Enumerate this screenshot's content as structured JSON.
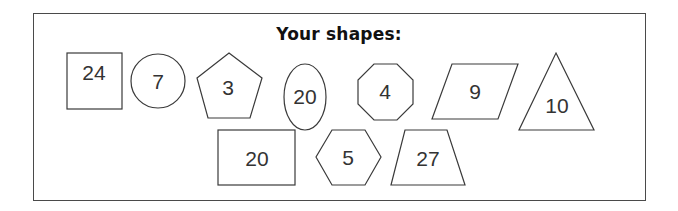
{
  "title": "Your shapes:",
  "shapes": [
    {
      "name": "square",
      "label": "24"
    },
    {
      "name": "circle",
      "label": "7"
    },
    {
      "name": "pentagon",
      "label": "3"
    },
    {
      "name": "ellipse",
      "label": "20"
    },
    {
      "name": "octagon",
      "label": "4"
    },
    {
      "name": "parallelogram",
      "label": "9"
    },
    {
      "name": "triangle",
      "label": "10"
    },
    {
      "name": "rectangle",
      "label": "20"
    },
    {
      "name": "hexagon",
      "label": "5"
    },
    {
      "name": "trapezoid",
      "label": "27"
    }
  ]
}
